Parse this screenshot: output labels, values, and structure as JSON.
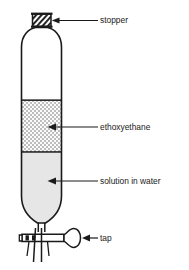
{
  "figure": {
    "type": "laboratory-apparatus-diagram",
    "background_color": "#ffffff",
    "outline_color": "#1a1a1a"
  },
  "labels": {
    "stopper": "stopper",
    "ethoxyethane": "ethoxyethane",
    "solution_in_water": "solution in water",
    "tap": "tap"
  },
  "apparatus": {
    "vessel_name": "separating-funnel",
    "stopper_fill": "hatched",
    "layers": [
      {
        "name": "ethoxyethane",
        "fill_style": "checkered",
        "color": "#c9c9c9",
        "position": "upper"
      },
      {
        "name": "solution in water",
        "fill_style": "solid",
        "color": "#e3e3e3",
        "position": "lower"
      }
    ],
    "tap_name": "stopcock-tap"
  }
}
